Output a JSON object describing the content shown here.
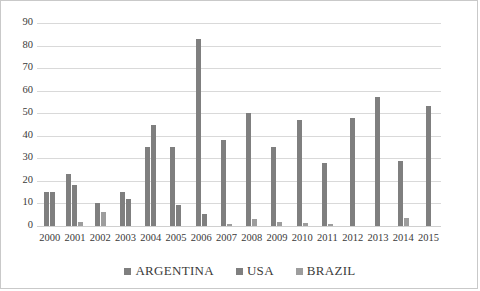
{
  "chart_data": {
    "type": "bar",
    "title": "",
    "xlabel": "",
    "ylabel": "",
    "ylim": [
      0,
      90
    ],
    "ytick_step": 10,
    "grid": true,
    "legend_position": "bottom",
    "categories": [
      "2000",
      "2001",
      "2002",
      "2003",
      "2004",
      "2005",
      "2006",
      "2007",
      "2008",
      "2009",
      "2010",
      "2011",
      "2012",
      "2013",
      "2014",
      "2015"
    ],
    "yticks": [
      "0",
      "10",
      "20",
      "30",
      "40",
      "50",
      "60",
      "70",
      "80",
      "90"
    ],
    "series": [
      {
        "name": "ARGENTINA",
        "color": "#7f7f7f",
        "values": [
          15,
          23,
          10,
          15,
          35,
          35,
          83,
          38,
          50,
          35,
          47,
          28,
          48,
          57,
          29,
          53
        ]
      },
      {
        "name": "USA",
        "color": "#7f7f7f",
        "values": [
          15,
          18,
          0,
          12,
          45,
          9.5,
          5.5,
          0,
          0,
          0,
          0,
          0,
          0,
          0,
          0,
          0
        ]
      },
      {
        "name": "BRAZIL",
        "color": "#9d9d9d",
        "values": [
          0,
          2,
          6,
          0,
          0,
          0,
          0,
          1,
          3,
          2,
          1.2,
          1,
          0,
          0,
          3.5,
          0
        ]
      }
    ]
  }
}
